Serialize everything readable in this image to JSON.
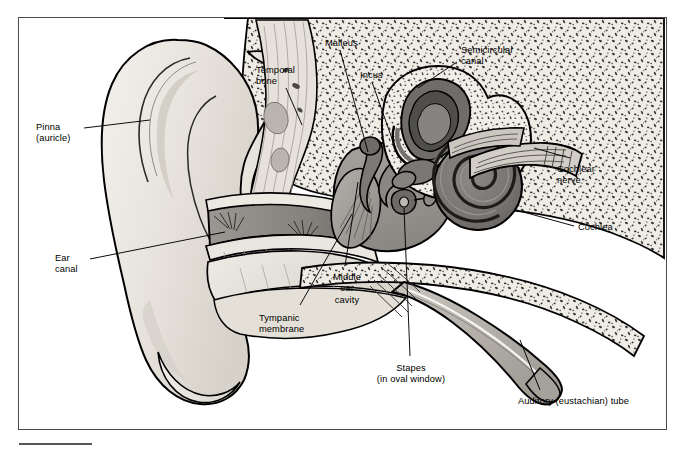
{
  "figure": {
    "frame_color": "#4b4b4b",
    "background": "#ffffff"
  },
  "palette": {
    "outline": "#000000",
    "bone_fill": "#efece6",
    "bone_stipple": "#3a3a3a",
    "cartilage_fill": "#e2ded6",
    "canal_fill": "#8d8a86",
    "middle_ear_fill": "#9a9691",
    "inner_ear_fill": "#7d7a77",
    "cochlea_fill": "#6f6c69",
    "tube_fill": "#b9b5ae",
    "membrane_fill": "#a3a09b",
    "nerve_fill": "#cfcbc4",
    "leader_line": "#000000",
    "label_text": "#000000"
  },
  "labels": [
    {
      "id": "pinna",
      "lines": [
        "Pinna",
        "(auricle)"
      ],
      "x": 36,
      "y": 122,
      "align": "left"
    },
    {
      "id": "ear-canal",
      "lines": [
        "Ear",
        "canal"
      ],
      "x": 55,
      "y": 253,
      "align": "left"
    },
    {
      "id": "temporal-bone",
      "lines": [
        "Temporal",
        "bone"
      ],
      "x": 256,
      "y": 65,
      "align": "left"
    },
    {
      "id": "malleus",
      "lines": [
        "Malleus"
      ],
      "x": 325,
      "y": 38,
      "align": "left"
    },
    {
      "id": "incus",
      "lines": [
        "Incus"
      ],
      "x": 360,
      "y": 70,
      "align": "left"
    },
    {
      "id": "semicircular-canal",
      "lines": [
        "Semicircular",
        "canal"
      ],
      "x": 461,
      "y": 45,
      "align": "left"
    },
    {
      "id": "cochlear-nerve",
      "lines": [
        "Cochlear",
        "nerve"
      ],
      "x": 557,
      "y": 164,
      "align": "left"
    },
    {
      "id": "cochlea",
      "lines": [
        "Cochlea"
      ],
      "x": 578,
      "y": 222,
      "align": "left"
    },
    {
      "id": "tympanic-membrane",
      "lines": [
        "Tympanic",
        "membrane"
      ],
      "x": 259,
      "y": 313,
      "align": "left"
    },
    {
      "id": "middle-ear-cavity",
      "lines": [
        "Middle",
        "ear",
        "cavity"
      ],
      "x": 347,
      "y": 272,
      "align": "center"
    },
    {
      "id": "stapes",
      "lines": [
        "Stapes",
        "(in oval window)"
      ],
      "x": 411,
      "y": 363,
      "align": "center"
    },
    {
      "id": "auditory-tube",
      "lines": [
        "Auditory (eustachian) tube"
      ],
      "x": 518,
      "y": 396,
      "align": "left"
    }
  ],
  "structures": [
    {
      "name": "pinna",
      "label": "Pinna (auricle)",
      "region": "outer ear"
    },
    {
      "name": "ear-canal",
      "label": "Ear canal",
      "region": "outer ear"
    },
    {
      "name": "tympanic-membrane",
      "label": "Tympanic membrane",
      "region": "outer/middle boundary"
    },
    {
      "name": "temporal-bone",
      "label": "Temporal bone",
      "region": "skull"
    },
    {
      "name": "malleus",
      "label": "Malleus",
      "region": "middle ear"
    },
    {
      "name": "incus",
      "label": "Incus",
      "region": "middle ear"
    },
    {
      "name": "stapes",
      "label": "Stapes (in oval window)",
      "region": "middle ear"
    },
    {
      "name": "middle-ear-cavity",
      "label": "Middle ear cavity",
      "region": "middle ear"
    },
    {
      "name": "auditory-tube",
      "label": "Auditory (eustachian) tube",
      "region": "middle ear"
    },
    {
      "name": "semicircular-canal",
      "label": "Semicircular canal",
      "region": "inner ear"
    },
    {
      "name": "cochlea",
      "label": "Cochlea",
      "region": "inner ear"
    },
    {
      "name": "cochlear-nerve",
      "label": "Cochlear nerve",
      "region": "inner ear"
    }
  ]
}
